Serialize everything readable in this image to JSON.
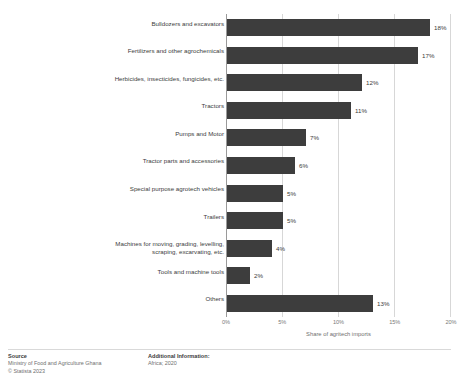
{
  "chart_data": {
    "type": "bar",
    "orientation": "horizontal",
    "title": "",
    "xlabel": "Share of agritech imports",
    "ylabel": "",
    "xlim": [
      0,
      20
    ],
    "xticks": [
      "0%",
      "5%",
      "10%",
      "15%",
      "20%"
    ],
    "xtick_values": [
      0,
      5,
      10,
      15,
      20
    ],
    "grid": true,
    "legend": "none",
    "bar_color": "#3d3d3d",
    "categories": [
      "Bulldozers and excavators",
      "Fertilizers and other agrochemicals",
      "Herbicides, insecticides, fungicides, etc.",
      "Tractors",
      "Pumps and Motor",
      "Tractor parts and accessories",
      "Special purpose agrotech vehicles",
      "Trailers",
      "Machines for moving, grading, levelling,\nscraping, excarvating, etc.",
      "Tools and machine tools",
      "Others"
    ],
    "values": [
      18,
      17,
      12,
      11,
      7,
      6,
      5,
      5,
      4,
      2,
      13
    ],
    "value_labels": [
      "18%",
      "17%",
      "12%",
      "11%",
      "7%",
      "6%",
      "5%",
      "5%",
      "4%",
      "2%",
      "13%"
    ]
  },
  "footer": {
    "source_head": "Source",
    "source_lines": [
      "Ministry of Food and Agriculture Ghana",
      "© Statista 2023"
    ],
    "additional_head": "Additional Information:",
    "additional_lines": [
      "Africa; 2020"
    ]
  }
}
